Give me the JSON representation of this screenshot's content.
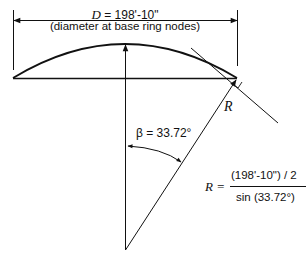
{
  "diagram": {
    "dimension": {
      "symbol": "D",
      "value_text": " = 198'-10\"",
      "caption": "(diameter at base ring nodes)"
    },
    "radius_label": "R",
    "angle": {
      "symbol": "β",
      "value_text": " = 33.72°",
      "degrees": 33.72
    },
    "formula": {
      "lhs": "R =",
      "numerator": "(198'-10\") / 2",
      "denominator": "sin (33.72°)"
    },
    "colors": {
      "line": "#111111",
      "background": "#ffffff"
    }
  }
}
